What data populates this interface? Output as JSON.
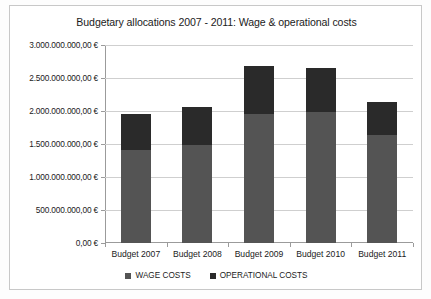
{
  "chart_data": {
    "type": "bar",
    "subtype": "stacked-column",
    "title": "Budgetary allocations 2007 - 2011: Wage & operational costs",
    "xlabel": "",
    "ylabel": "",
    "categories": [
      "Budget  2007",
      "Budget  2008",
      "Budget  2009",
      "Budget  2010",
      "Budget  2011"
    ],
    "series": [
      {
        "name": "WAGE COSTS",
        "color": "#545454",
        "values": [
          1410000000,
          1490000000,
          1960000000,
          1990000000,
          1640000000
        ]
      },
      {
        "name": "OPERATIONAL COSTS",
        "color": "#2a2a2a",
        "values": [
          550000000,
          570000000,
          730000000,
          670000000,
          500000000
        ]
      }
    ],
    "totals": [
      1960000000,
      2060000000,
      2690000000,
      2660000000,
      2140000000
    ],
    "ylim": [
      0,
      3000000000
    ],
    "ytick_values": [
      0,
      500000000,
      1000000000,
      1500000000,
      2000000000,
      2500000000,
      3000000000
    ],
    "ytick_labels": [
      "0,00 €",
      "500.000.000,00 €",
      "1.000.000.000,00 €",
      "1.500.000.000,00 €",
      "2.000.000.000,00 €",
      "2.500.000.000,00 €",
      "3.000.000.000,00 €"
    ],
    "grid": true,
    "grid_axis": "y",
    "legend_position": "bottom",
    "legend": [
      "WAGE COSTS",
      "OPERATIONAL COSTS"
    ],
    "currency": "EUR",
    "number_format": "de-DE"
  },
  "colors": {
    "wage": "#545454",
    "operational": "#2a2a2a",
    "gridline": "#cfcfcf",
    "axis": "#9b9b9b",
    "text": "#1b1b1b",
    "background": "#ffffff",
    "frame_border": "#c8c8c8"
  }
}
